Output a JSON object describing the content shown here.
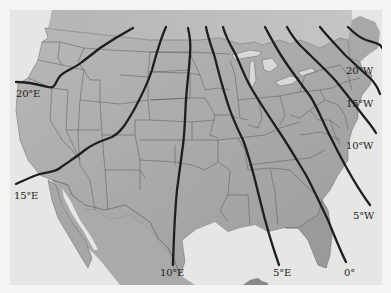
{
  "map": {
    "subject": "Isogonic lines (magnetic declination) over the contiguous United States",
    "colors": {
      "land": "#b3b3b3",
      "land_dark": "#9a9a9a",
      "water": "#e6e6e4",
      "borders": "#555555",
      "isogonic_lines": "#1e1e1e",
      "label": "#222222"
    },
    "isogonic_lines": [
      {
        "label": "20°E",
        "value": 20,
        "direction": "E"
      },
      {
        "label": "15°E",
        "value": 15,
        "direction": "E"
      },
      {
        "label": "10°E",
        "value": 10,
        "direction": "E"
      },
      {
        "label": "5°E",
        "value": 5,
        "direction": "E"
      },
      {
        "label": "0°",
        "value": 0,
        "direction": ""
      },
      {
        "label": "5°W",
        "value": 5,
        "direction": "W"
      },
      {
        "label": "10°W",
        "value": 10,
        "direction": "W"
      },
      {
        "label": "15°W",
        "value": 15,
        "direction": "W"
      },
      {
        "label": "20°W",
        "value": 20,
        "direction": "W"
      }
    ]
  }
}
